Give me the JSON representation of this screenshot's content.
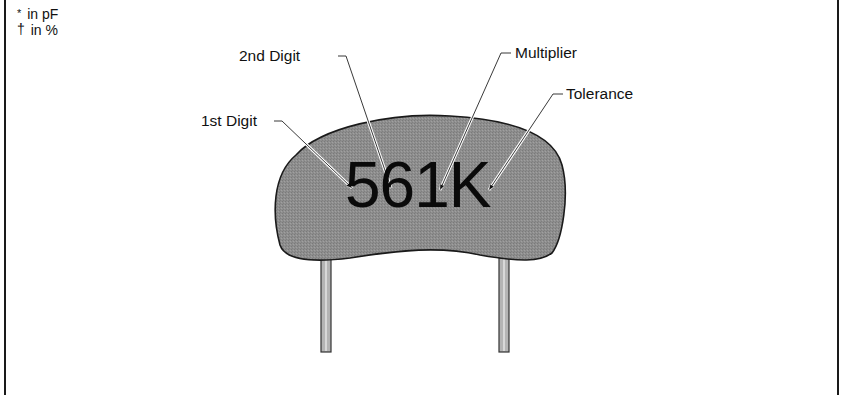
{
  "notes": [
    {
      "symbol": "*",
      "text": "in pF"
    },
    {
      "symbol": "†",
      "text": "in %"
    }
  ],
  "capacitor": {
    "marking": "561K",
    "body_color": "#8c8c8c",
    "lead_color": "#b0b0b0"
  },
  "callouts": [
    {
      "id": "first-digit",
      "label": "1st Digit"
    },
    {
      "id": "second-digit",
      "label": "2nd Digit"
    },
    {
      "id": "multiplier",
      "label": "Multiplier"
    },
    {
      "id": "tolerance",
      "label": "Tolerance"
    }
  ]
}
